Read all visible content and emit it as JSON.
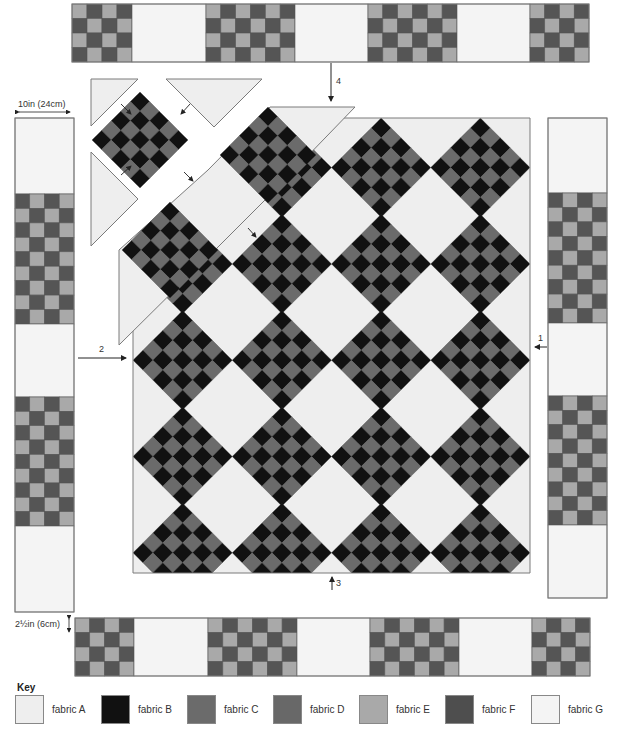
{
  "labels": {
    "width_measure": "10in (24cm)",
    "strip_measure": "2½in (6cm)",
    "step_1": "1",
    "step_2": "2",
    "step_3": "3",
    "step_4": "4"
  },
  "colors": {
    "fabric_a": "#eeeeee",
    "fabric_b": "#111111",
    "fabric_c": "#6b6b6b",
    "fabric_d": "#686868",
    "fabric_e": "#a9a9a9",
    "fabric_f": "#4e4e4e",
    "fabric_g": "#f4f4f4",
    "outline": "#7a7a7a"
  },
  "quilt": {
    "center_columns": 4,
    "center_rows": 5,
    "block_grid": 5,
    "border_checker_light": "#a9a9a9",
    "border_checker_dark": "#555555"
  },
  "key": {
    "title": "Key",
    "items": [
      {
        "label": "fabric A",
        "color": "#eeeeee"
      },
      {
        "label": "fabric B",
        "color": "#111111"
      },
      {
        "label": "fabric C",
        "color": "#6b6b6b"
      },
      {
        "label": "fabric D",
        "color": "#686868"
      },
      {
        "label": "fabric E",
        "color": "#a9a9a9"
      },
      {
        "label": "fabric F",
        "color": "#4e4e4e"
      },
      {
        "label": "fabric G",
        "color": "#f4f4f4"
      }
    ]
  }
}
